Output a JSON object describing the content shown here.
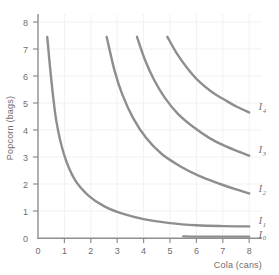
{
  "chart_data": {
    "type": "line",
    "title": "",
    "xlabel": "Cola (cans)",
    "ylabel": "Popcorn (bags)",
    "xlim": [
      0,
      8.4
    ],
    "ylim": [
      0,
      8.4
    ],
    "xticks": [
      "0",
      "1",
      "2",
      "3",
      "4",
      "5",
      "6",
      "7",
      "8"
    ],
    "yticks": [
      "0",
      "1",
      "2",
      "3",
      "4",
      "5",
      "6",
      "7",
      "8"
    ],
    "grid": true,
    "legend_position": "inline-right",
    "curve_color": "#8e8e8e",
    "axis_color": "#8e8e8e",
    "grid_color": "#f0f0f0",
    "series": [
      {
        "name": "I0",
        "label": "I",
        "subscript": "0",
        "label_x": 8.25,
        "label_y": 0.12,
        "k": 0.0,
        "points": [
          [
            5.5,
            0.06
          ],
          [
            6.0,
            0.05
          ],
          [
            6.5,
            0.05
          ],
          [
            7.0,
            0.05
          ],
          [
            7.5,
            0.05
          ],
          [
            8.0,
            0.05
          ]
        ]
      },
      {
        "name": "I1",
        "label": "I",
        "subscript": "1",
        "label_x": 8.25,
        "label_y": 0.62,
        "k": 2.6,
        "points": [
          [
            0.35,
            7.45
          ],
          [
            0.5,
            5.9
          ],
          [
            0.7,
            4.3
          ],
          [
            1.0,
            3.05
          ],
          [
            1.4,
            2.15
          ],
          [
            1.9,
            1.58
          ],
          [
            2.5,
            1.18
          ],
          [
            3.2,
            0.9
          ],
          [
            4.0,
            0.7
          ],
          [
            5.0,
            0.55
          ],
          [
            6.0,
            0.47
          ],
          [
            7.0,
            0.44
          ],
          [
            8.0,
            0.43
          ]
        ]
      },
      {
        "name": "I2",
        "label": "I",
        "subscript": "2",
        "label_x": 8.25,
        "label_y": 1.8,
        "k": 19.5,
        "points": [
          [
            2.6,
            7.45
          ],
          [
            2.9,
            6.2
          ],
          [
            3.2,
            5.3
          ],
          [
            3.6,
            4.45
          ],
          [
            4.1,
            3.7
          ],
          [
            4.7,
            3.1
          ],
          [
            5.4,
            2.65
          ],
          [
            6.1,
            2.3
          ],
          [
            6.9,
            2.0
          ],
          [
            7.5,
            1.8
          ],
          [
            8.0,
            1.65
          ]
        ]
      },
      {
        "name": "I3",
        "label": "I",
        "subscript": "3",
        "label_x": 8.25,
        "label_y": 3.25,
        "k": 27.9,
        "points": [
          [
            3.75,
            7.45
          ],
          [
            4.05,
            6.6
          ],
          [
            4.4,
            5.85
          ],
          [
            4.8,
            5.2
          ],
          [
            5.3,
            4.6
          ],
          [
            5.9,
            4.1
          ],
          [
            6.5,
            3.7
          ],
          [
            7.1,
            3.4
          ],
          [
            7.6,
            3.2
          ],
          [
            8.0,
            3.05
          ]
        ]
      },
      {
        "name": "I4",
        "label": "I",
        "subscript": "4",
        "label_x": 8.25,
        "label_y": 4.85,
        "k": 36.5,
        "points": [
          [
            4.9,
            7.45
          ],
          [
            5.25,
            6.85
          ],
          [
            5.65,
            6.3
          ],
          [
            6.1,
            5.8
          ],
          [
            6.6,
            5.4
          ],
          [
            7.1,
            5.1
          ],
          [
            7.55,
            4.85
          ],
          [
            8.0,
            4.65
          ]
        ]
      }
    ]
  }
}
